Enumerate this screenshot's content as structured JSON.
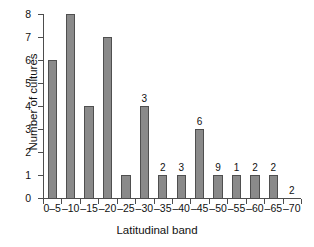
{
  "chart_data": {
    "type": "bar",
    "title": "",
    "xlabel": "Latitudinal band",
    "ylabel": "Number of cultures",
    "categories": [
      "0–5",
      "–10",
      "–15",
      "–20",
      "–25",
      "–30",
      "–35",
      "–40",
      "–45",
      "–50",
      "–55",
      "–60",
      "–65",
      "–70"
    ],
    "values": [
      6,
      8,
      4,
      7,
      1,
      4,
      1,
      1,
      3,
      1,
      1,
      1,
      1,
      0
    ],
    "point_labels": [
      "",
      "",
      "",
      "",
      "",
      "3",
      "2",
      "3",
      "6",
      "9",
      "1",
      "2",
      "2",
      "2"
    ],
    "ylim": [
      0,
      8
    ],
    "yticks": [
      0,
      1,
      2,
      3,
      4,
      5,
      6,
      7,
      8
    ],
    "ytick_labels": [
      "0",
      "1",
      "2",
      "3",
      "4",
      "5",
      "6",
      "7",
      "8"
    ],
    "grid": false,
    "legend": null,
    "bar_color": "#8a8a8a",
    "bar_edge_color": "#4f4f4f",
    "axis_color": "#4d4d4d",
    "background": "#ffffff"
  }
}
